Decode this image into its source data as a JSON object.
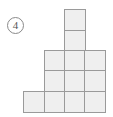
{
  "figure": {
    "marker": {
      "label": "④",
      "number": "4",
      "style": "circled-number"
    },
    "title": "",
    "shape": {
      "name": "staircase-block-figure",
      "description": "Figure built from unit squares arranged as a stepped pyramid",
      "columns": 4,
      "rows": 5,
      "total_squares": 12,
      "row_square_counts": [
        1,
        1,
        3,
        3,
        4
      ],
      "grid": [
        [
          0,
          0,
          1,
          0
        ],
        [
          0,
          0,
          1,
          0
        ],
        [
          0,
          1,
          1,
          1
        ],
        [
          0,
          1,
          1,
          1
        ],
        [
          1,
          1,
          1,
          1
        ]
      ]
    },
    "colors": {
      "cell_fill": "#efefef",
      "cell_border": "#9a9a9a",
      "marker_text": "#555555",
      "marker_border": "#8a8a8a",
      "background": "#ffffff"
    }
  }
}
